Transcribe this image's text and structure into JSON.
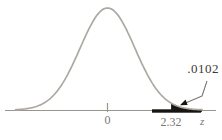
{
  "chart_data": {
    "type": "area",
    "title": "",
    "curve": "standard normal density",
    "xlabel": "z",
    "ylabel": "",
    "grid": false,
    "legend": "none",
    "x_range": [
      -3.35,
      3.45
    ],
    "x_ticks": [
      {
        "z": 0,
        "label": "0"
      },
      {
        "z": 2.32,
        "label": "2.32"
      }
    ],
    "shaded_region": {
      "from_z": 2.32,
      "tail": "right",
      "area": 0.0102,
      "area_label": ".0102"
    },
    "colors": {
      "curve": "#ada9a2",
      "axis": "#9a968f",
      "labels": "#7b7872",
      "annotation": "#3c3a35",
      "shade": "#161511"
    }
  }
}
